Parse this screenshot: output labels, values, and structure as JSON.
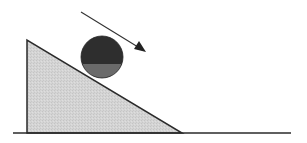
{
  "diagram": {
    "title": "Ball on inclined plane",
    "elements": [
      {
        "id": "ground",
        "type": "line",
        "label": "ground"
      },
      {
        "id": "incline",
        "type": "right-triangle",
        "label": "inclined plane"
      },
      {
        "id": "ball",
        "type": "sphere",
        "label": "ball"
      },
      {
        "id": "arrow",
        "type": "arrow",
        "label": "direction of motion (down the incline)"
      }
    ],
    "colors": {
      "background": "#ffffff",
      "incline_fill": "#d4d4d4",
      "outline": "#2a2a2a",
      "ball_top": "#2e2e2e",
      "ball_bottom": "#6a6a6a",
      "arrow": "#333333"
    },
    "geometry": {
      "ground": {
        "x1": 13,
        "y1": 133,
        "x2": 291,
        "y2": 133
      },
      "incline": {
        "top": [
          27,
          40
        ],
        "bottom_left": [
          27,
          133
        ],
        "bottom_right": [
          182,
          133
        ]
      },
      "ball": {
        "cx": 102,
        "cy": 57,
        "r": 21
      },
      "arrow": {
        "x1": 81,
        "y1": 12,
        "x2": 146,
        "y2": 52
      }
    }
  }
}
